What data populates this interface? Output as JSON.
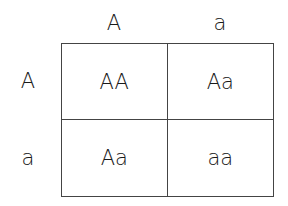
{
  "punnett_square": {
    "column_alleles": [
      "A",
      "a"
    ],
    "row_alleles": [
      "A",
      "a"
    ],
    "cells": [
      [
        "AA",
        "Aa"
      ],
      [
        "Aa",
        "aa"
      ]
    ]
  },
  "colors": {
    "text": "#1a1a1a",
    "grid_line": "#444444",
    "background": "#ffffff"
  }
}
